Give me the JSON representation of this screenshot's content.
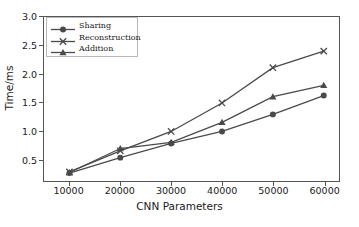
{
  "chart_data": {
    "type": "line",
    "title": "",
    "xlabel": "CNN Parameters",
    "ylabel": "Time/ms",
    "x": [
      10000,
      20000,
      30000,
      40000,
      50000,
      60000
    ],
    "xticklabels": [
      "10000",
      "20000",
      "30000",
      "40000",
      "50000",
      "60000"
    ],
    "yticklabels": [
      "0.5",
      "1.0",
      "1.5",
      "2.0",
      "2.5",
      "3.0"
    ],
    "yticks": [
      0.5,
      1.0,
      1.5,
      2.0,
      2.5,
      3.0
    ],
    "xlim": [
      5000,
      63000
    ],
    "ylim": [
      0.12,
      3.0
    ],
    "grid": false,
    "legend_position": "upper left",
    "series": [
      {
        "name": "Sharing",
        "marker": "circle",
        "color": "#4a4a4a",
        "values": [
          0.26,
          0.53,
          0.78,
          0.99,
          1.29,
          1.62
        ]
      },
      {
        "name": "Reconstruction",
        "marker": "x",
        "color": "#4a4a4a",
        "values": [
          0.28,
          0.65,
          0.99,
          1.49,
          2.11,
          2.4
        ]
      },
      {
        "name": "Addition",
        "marker": "triangle",
        "color": "#4a4a4a",
        "values": [
          0.27,
          0.69,
          0.8,
          1.15,
          1.6,
          1.8
        ]
      }
    ]
  },
  "legend": {
    "items": [
      {
        "label": "Sharing"
      },
      {
        "label": "Reconstruction"
      },
      {
        "label": "Addition"
      }
    ]
  },
  "axes": {
    "x_label": "CNN Parameters",
    "y_label": "Time/ms"
  },
  "colors": {
    "line": "#4a4a4a",
    "spine": "#555555",
    "text": "#1a1a1a",
    "background": "#ffffff"
  }
}
